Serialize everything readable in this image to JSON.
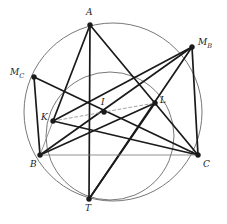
{
  "figure": {
    "width": 227,
    "height": 224,
    "background": "#ffffff",
    "stroke_dark": "#1a1a1a",
    "stroke_circle": "#555555",
    "stroke_thin": "#777777",
    "stroke_dashed": "#999999"
  },
  "points": [
    {
      "id": "A",
      "label": "A",
      "sub": "",
      "x": 90,
      "y": 25,
      "label_x": 86,
      "label_y": 8
    },
    {
      "id": "MB",
      "label": "M",
      "sub": "B",
      "x": 192,
      "y": 47,
      "label_x": 198,
      "label_y": 38
    },
    {
      "id": "MC",
      "label": "M",
      "sub": "C",
      "x": 34,
      "y": 77,
      "label_x": 10,
      "label_y": 68
    },
    {
      "id": "I",
      "label": "I",
      "sub": "",
      "x": 104,
      "y": 112,
      "label_x": 101,
      "label_y": 98
    },
    {
      "id": "L",
      "label": "L",
      "sub": "",
      "x": 155,
      "y": 103,
      "label_x": 160,
      "label_y": 96
    },
    {
      "id": "K",
      "label": "K",
      "sub": "",
      "x": 53,
      "y": 121,
      "label_x": 41,
      "label_y": 113
    },
    {
      "id": "B",
      "label": "B",
      "sub": "",
      "x": 40,
      "y": 155,
      "label_x": 30,
      "label_y": 160
    },
    {
      "id": "C",
      "label": "C",
      "sub": "",
      "x": 198,
      "y": 155,
      "label_x": 203,
      "label_y": 160
    },
    {
      "id": "T",
      "label": "T",
      "sub": "",
      "x": 89,
      "y": 199,
      "label_x": 85,
      "label_y": 204
    }
  ],
  "circles": [
    {
      "id": "circumcircle",
      "cx": 113,
      "cy": 112,
      "r": 89,
      "stroke": "#555555",
      "width": 0.8
    },
    {
      "id": "inner-circle",
      "cx": 110,
      "cy": 136,
      "r": 64,
      "stroke": "#555555",
      "width": 0.8
    }
  ],
  "segments": [
    {
      "id": "A-K",
      "from": "A",
      "to": "K",
      "style": "thick"
    },
    {
      "id": "A-T",
      "from": "A",
      "to": "T",
      "style": "thick"
    },
    {
      "id": "A-C",
      "from": "A",
      "to": "C",
      "style": "thick"
    },
    {
      "id": "MC-B",
      "from": "MC",
      "to": "B",
      "style": "thick"
    },
    {
      "id": "MC-C",
      "from": "MC",
      "to": "C",
      "style": "thick"
    },
    {
      "id": "MB-T",
      "from": "MB",
      "to": "T",
      "style": "thick"
    },
    {
      "id": "MB-K",
      "from": "MB",
      "to": "K",
      "style": "thick"
    },
    {
      "id": "MB-B",
      "from": "MB",
      "to": "B",
      "style": "thick"
    },
    {
      "id": "MB-C",
      "from": "MB",
      "to": "C",
      "style": "thick"
    },
    {
      "id": "B-L",
      "from": "B",
      "to": "L",
      "style": "thick"
    },
    {
      "id": "C-K",
      "from": "C",
      "to": "K",
      "style": "thick"
    },
    {
      "id": "T-L",
      "from": "T",
      "to": "L",
      "style": "thick"
    },
    {
      "id": "K-B",
      "from": "K",
      "to": "B",
      "style": "thin"
    },
    {
      "id": "B-C",
      "from": "B",
      "to": "C",
      "style": "thin"
    },
    {
      "id": "K-I-L",
      "from": "K",
      "to": "L",
      "style": "dashed"
    }
  ]
}
